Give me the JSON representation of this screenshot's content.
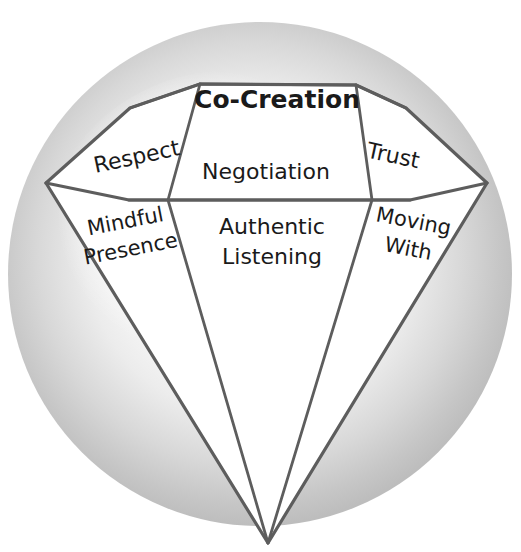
{
  "figure": {
    "shape": "diamond",
    "background_circle_color": "#c9c9c9",
    "background_page_color": "#ffffff",
    "line_color": "#5d5d5d",
    "facet_fill_color": "#ffffff",
    "text_color": "#1a1a1a"
  },
  "facets": {
    "table": {
      "label": "Co-Creation",
      "bold": true,
      "font_size": 25,
      "rotation": 0,
      "cx": 277,
      "cy": 101
    },
    "crown_left": {
      "label": "Respect",
      "bold": false,
      "font_size": 22,
      "rotation": -12,
      "cx": 137,
      "cy": 158
    },
    "crown_center": {
      "label": "Negotiation",
      "bold": false,
      "font_size": 22,
      "rotation": 0,
      "cx": 266,
      "cy": 173
    },
    "crown_right": {
      "label": "Trust",
      "bold": false,
      "font_size": 22,
      "rotation": 12,
      "cx": 393,
      "cy": 157
    },
    "pavilion_left": {
      "line1": "Mindful",
      "line2": "Presence",
      "bold": false,
      "font_size": 21,
      "rotation": -11,
      "cx": 128,
      "cy": 235
    },
    "pavilion_center": {
      "line1": "Authentic",
      "line2": "Listening",
      "bold": false,
      "font_size": 22,
      "rotation": 0,
      "cx": 272,
      "cy": 240
    },
    "pavilion_right": {
      "line1": "Moving",
      "line2": "With",
      "bold": false,
      "font_size": 21,
      "rotation": 11,
      "cx": 411,
      "cy": 235
    }
  },
  "geometry": {
    "circle": {
      "cx": 260,
      "cy": 274,
      "r": 252
    },
    "points": {
      "table_left": {
        "x": 200,
        "y": 84
      },
      "table_right": {
        "x": 356,
        "y": 85
      },
      "crown_left_top": {
        "x": 130,
        "y": 108
      },
      "crown_right_top": {
        "x": 406,
        "y": 108
      },
      "girdle_left": {
        "x": 46,
        "y": 183
      },
      "girdle_right": {
        "x": 487,
        "y": 183
      },
      "inner_left": {
        "x": 168,
        "y": 200
      },
      "inner_right": {
        "x": 372,
        "y": 200
      },
      "band_left": {
        "x": 129,
        "y": 200
      },
      "band_right": {
        "x": 410,
        "y": 200
      },
      "apex": {
        "x": 268,
        "y": 543
      }
    }
  }
}
